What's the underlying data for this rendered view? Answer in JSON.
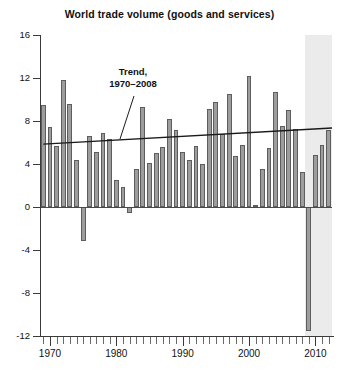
{
  "chart": {
    "title": "World trade volume (goods and services)",
    "annotation_line1": "Trend,",
    "annotation_line2": "1970–2008"
  },
  "axes": {
    "y_ticks": [
      "16",
      "12",
      "8",
      "4",
      "0",
      "-4",
      "-8",
      "-12"
    ],
    "x_ticks": [
      "1970",
      "1980",
      "1990",
      "2000",
      "2010"
    ]
  },
  "chart_data": {
    "type": "bar",
    "title": "World trade volume (goods and services)",
    "xlabel": "",
    "ylabel": "",
    "ylim": [
      -12,
      16
    ],
    "xlim": [
      1968.5,
      2012.5
    ],
    "grid": false,
    "legend": null,
    "annotations": [
      {
        "text": "Trend, 1970–2008",
        "x": 1978,
        "y": 11.0,
        "points_to_x": 1982,
        "points_to_y": 6.0
      }
    ],
    "shaded_regions": [
      {
        "label": "forecast",
        "x_start": 2008.5,
        "x_end": 2012.5,
        "color": "#ebebeb"
      }
    ],
    "series": [
      {
        "name": "World trade volume growth (percent)",
        "type": "bar",
        "color": "#9d9d9d",
        "categories": [
          1969,
          1970,
          1971,
          1972,
          1973,
          1974,
          1975,
          1976,
          1977,
          1978,
          1979,
          1980,
          1981,
          1982,
          1983,
          1984,
          1985,
          1986,
          1987,
          1988,
          1989,
          1990,
          1991,
          1992,
          1993,
          1994,
          1995,
          1996,
          1997,
          1998,
          1999,
          2000,
          2001,
          2002,
          2003,
          2004,
          2005,
          2006,
          2007,
          2008,
          2009,
          2010,
          2011,
          2012
        ],
        "values": [
          9.5,
          7.4,
          5.7,
          11.8,
          9.6,
          4.4,
          -3.2,
          6.6,
          5.1,
          6.9,
          6.3,
          2.5,
          1.9,
          -0.6,
          3.5,
          9.3,
          4.1,
          5.0,
          5.6,
          8.2,
          7.2,
          5.1,
          4.4,
          5.7,
          4.0,
          9.1,
          9.8,
          6.8,
          10.5,
          4.7,
          5.8,
          12.2,
          0.2,
          3.5,
          5.5,
          10.7,
          7.5,
          9.0,
          7.3,
          3.3,
          -11.5,
          4.8,
          5.8,
          7.2
        ]
      }
    ],
    "trend_line": {
      "name": "Trend, 1970–2008",
      "color": "#1a1a1a",
      "x_start": 1969,
      "y_start": 5.85,
      "x_end": 2012.5,
      "y_end": 7.35
    }
  }
}
